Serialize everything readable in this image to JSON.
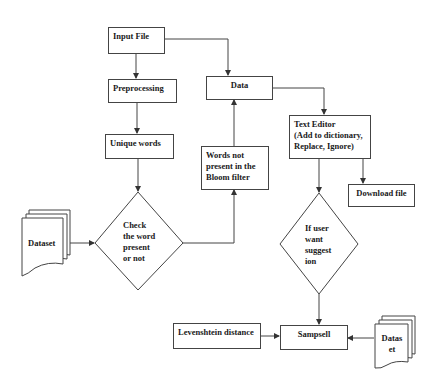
{
  "nodes": {
    "input_file": {
      "label": "Input File"
    },
    "preprocessing": {
      "label": "Preprocessing"
    },
    "unique_words": {
      "label": "Unique words"
    },
    "data": {
      "label": "Data"
    },
    "words_not_present": {
      "label": "Words not\npresent in the\nBloom filter"
    },
    "text_editor": {
      "label": "Text Editor\n(Add to dictionary,\nReplace, Ignore)"
    },
    "download_file": {
      "label": "Download file"
    },
    "check_word": {
      "label": "Check\nthe word\npresent\nor not"
    },
    "user_suggestion": {
      "label": "If user\nwant\nsuggest\nion"
    },
    "dataset_left": {
      "label": "Dataset"
    },
    "levenshtein": {
      "label": "Levenshtein distance"
    },
    "sampsell": {
      "label": "Sampsell"
    },
    "dataset_right": {
      "label": "Datas\net"
    }
  },
  "edges": [
    {
      "from": "input_file",
      "to": "preprocessing"
    },
    {
      "from": "input_file",
      "to": "data"
    },
    {
      "from": "preprocessing",
      "to": "unique_words"
    },
    {
      "from": "unique_words",
      "to": "check_word"
    },
    {
      "from": "dataset_left",
      "to": "check_word"
    },
    {
      "from": "check_word",
      "to": "words_not_present"
    },
    {
      "from": "words_not_present",
      "to": "data"
    },
    {
      "from": "data",
      "to": "text_editor"
    },
    {
      "from": "text_editor",
      "to": "user_suggestion"
    },
    {
      "from": "text_editor",
      "to": "download_file"
    },
    {
      "from": "user_suggestion",
      "to": "sampsell"
    },
    {
      "from": "levenshtein",
      "to": "sampsell"
    },
    {
      "from": "dataset_right",
      "to": "sampsell"
    }
  ],
  "colors": {
    "stroke": "#444444",
    "text": "#1a1a1a",
    "background": "#ffffff"
  }
}
